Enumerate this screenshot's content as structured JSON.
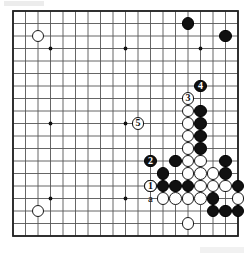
{
  "diagram": {
    "kind": "go-board-diagram",
    "board_size": 19,
    "origin_x": 13,
    "origin_y": 11,
    "spacing": 12.5,
    "stone_radius": 6.4,
    "line_color": "#555555",
    "border_color": "#222222",
    "black_color": "#111111",
    "white_color": "#ffffff",
    "background_color": "#ffffff",
    "star_points": [
      [
        3,
        3
      ],
      [
        9,
        3
      ],
      [
        15,
        3
      ],
      [
        3,
        9
      ],
      [
        9,
        9
      ],
      [
        15,
        9
      ],
      [
        3,
        15
      ],
      [
        9,
        15
      ],
      [
        15,
        15
      ]
    ],
    "black_stones": [
      [
        14,
        1
      ],
      [
        17,
        2
      ],
      [
        15,
        8
      ],
      [
        15,
        9
      ],
      [
        15,
        10
      ],
      [
        15,
        11
      ],
      [
        13,
        12
      ],
      [
        12,
        13
      ],
      [
        17,
        12
      ],
      [
        17,
        13
      ],
      [
        12,
        14
      ],
      [
        13,
        14
      ],
      [
        14,
        14
      ],
      [
        18,
        14
      ],
      [
        16,
        15
      ],
      [
        16,
        16
      ],
      [
        17,
        16
      ],
      [
        18,
        16
      ]
    ],
    "white_stones": [
      [
        2,
        2
      ],
      [
        2,
        16
      ],
      [
        14,
        8
      ],
      [
        14,
        9
      ],
      [
        14,
        10
      ],
      [
        14,
        11
      ],
      [
        14,
        12
      ],
      [
        15,
        12
      ],
      [
        14,
        13
      ],
      [
        15,
        13
      ],
      [
        16,
        13
      ],
      [
        11,
        14
      ],
      [
        15,
        14
      ],
      [
        16,
        14
      ],
      [
        17,
        14
      ],
      [
        12,
        15
      ],
      [
        13,
        15
      ],
      [
        14,
        15
      ],
      [
        15,
        15
      ],
      [
        18,
        15
      ],
      [
        14,
        17
      ]
    ],
    "markers": [
      {
        "label": "1",
        "col": 11,
        "row": 14,
        "on": "white",
        "name": "move-1-marker"
      },
      {
        "label": "2",
        "col": 11,
        "row": 12,
        "on": "black",
        "name": "move-2-marker"
      },
      {
        "label": "3",
        "col": 14,
        "row": 7,
        "on": "white",
        "name": "move-3-marker"
      },
      {
        "label": "4",
        "col": 15,
        "row": 6,
        "on": "black",
        "name": "move-4-marker"
      },
      {
        "label": "5",
        "col": 10,
        "row": 9,
        "on": "white",
        "name": "move-5-marker"
      }
    ],
    "letter_labels": [
      {
        "label": "a",
        "col": 11,
        "row": 15,
        "name": "point-a-label"
      }
    ]
  }
}
